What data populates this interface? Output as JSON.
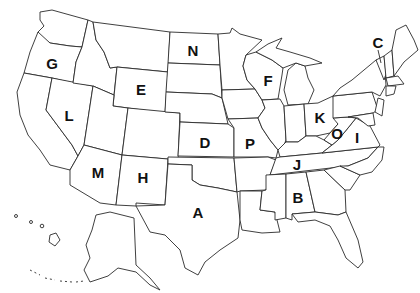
{
  "map": {
    "type": "US states outline quiz map",
    "line_color": "#2a2a2a",
    "background": "#ffffff",
    "labels": [
      {
        "letter": "G",
        "state": "Oregon",
        "x": 52,
        "y": 63
      },
      {
        "letter": "N",
        "state": "North Dakota",
        "x": 193,
        "y": 50
      },
      {
        "letter": "E",
        "state": "Wyoming",
        "x": 141,
        "y": 89
      },
      {
        "letter": "L",
        "state": "Nevada",
        "x": 69,
        "y": 115
      },
      {
        "letter": "F",
        "state": "Wisconsin",
        "x": 268,
        "y": 80
      },
      {
        "letter": "C",
        "state": "Vermont",
        "x": 378,
        "y": 42
      },
      {
        "letter": "D",
        "state": "Kansas",
        "x": 205,
        "y": 142
      },
      {
        "letter": "P",
        "state": "Missouri",
        "x": 250,
        "y": 143
      },
      {
        "letter": "K",
        "state": "Ohio",
        "x": 320,
        "y": 117
      },
      {
        "letter": "O",
        "state": "West Virginia",
        "x": 337,
        "y": 133
      },
      {
        "letter": "I",
        "state": "Virginia",
        "x": 357,
        "y": 137
      },
      {
        "letter": "M",
        "state": "Arizona",
        "x": 98,
        "y": 172
      },
      {
        "letter": "H",
        "state": "New Mexico",
        "x": 143,
        "y": 177
      },
      {
        "letter": "J",
        "state": "Tennessee",
        "x": 297,
        "y": 164
      },
      {
        "letter": "B",
        "state": "Alabama",
        "x": 298,
        "y": 197
      },
      {
        "letter": "A",
        "state": "Texas",
        "x": 198,
        "y": 212
      }
    ]
  }
}
